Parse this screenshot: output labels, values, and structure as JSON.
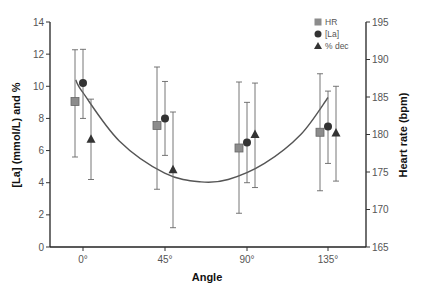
{
  "chart_data": {
    "type": "scatter",
    "title": "",
    "xlabel": "Angle",
    "ylabel": "[La] (mmol/L) and %",
    "y2label": "Heart rate (bpm)",
    "categories": [
      "0°",
      "45°",
      "90°",
      "135°"
    ],
    "x": [
      0,
      45,
      90,
      135
    ],
    "ylim": [
      0,
      14
    ],
    "yticks": [
      0,
      2,
      4,
      6,
      8,
      10,
      12,
      14
    ],
    "y2lim": [
      165,
      195
    ],
    "y2ticks": [
      165,
      170,
      175,
      180,
      185,
      190,
      195
    ],
    "grid": false,
    "legend_position": "top-right",
    "series": [
      {
        "name": "HR",
        "marker": "square",
        "color": "#8c8c8c",
        "axis": "right",
        "values": [
          184.4,
          181.2,
          178.2,
          180.3
        ],
        "err_low": [
          177.0,
          172.7,
          169.5,
          172.5
        ],
        "err_high": [
          191.3,
          189.0,
          187.0,
          188.1
        ]
      },
      {
        "name": "[La]",
        "marker": "circle",
        "color": "#333333",
        "axis": "left",
        "values": [
          10.2,
          8.0,
          6.5,
          7.5
        ],
        "err_low": [
          8.0,
          5.7,
          4.0,
          5.2
        ],
        "err_high": [
          12.3,
          10.3,
          9.0,
          9.7
        ]
      },
      {
        "name": "% dec",
        "marker": "triangle",
        "color": "#333333",
        "axis": "left",
        "values": [
          6.7,
          4.8,
          7.0,
          7.1
        ],
        "err_low": [
          4.2,
          1.2,
          3.7,
          4.1
        ],
        "err_high": [
          9.2,
          8.4,
          10.2,
          10.0
        ]
      }
    ],
    "fit_curve": {
      "description": "quadratic trend line",
      "points": [
        [
          -4,
          10.4
        ],
        [
          0,
          9.6
        ],
        [
          20,
          6.6
        ],
        [
          45,
          4.6
        ],
        [
          65,
          4.05
        ],
        [
          80,
          4.2
        ],
        [
          100,
          5.2
        ],
        [
          120,
          7.0
        ],
        [
          135,
          9.3
        ]
      ]
    }
  }
}
